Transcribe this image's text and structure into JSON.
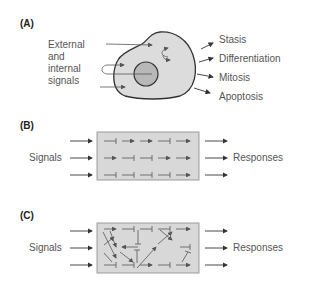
{
  "panels": {
    "a": {
      "label": "(A)",
      "input_label_lines": [
        "External",
        "and",
        "internal",
        "signals"
      ],
      "outcomes": [
        "Stasis",
        "Differentiation",
        "Mitosis",
        "Apoptosis"
      ]
    },
    "b": {
      "label": "(B)",
      "input_label": "Signals",
      "output_label": "Responses"
    },
    "c": {
      "label": "(C)",
      "input_label": "Signals",
      "output_label": "Responses"
    }
  },
  "colors": {
    "cell_fill": "#dcdcdc",
    "nucleus_fill": "#b8b8b8",
    "box_fill": "#d8d8d8",
    "stroke": "#333333",
    "text": "#555555"
  }
}
